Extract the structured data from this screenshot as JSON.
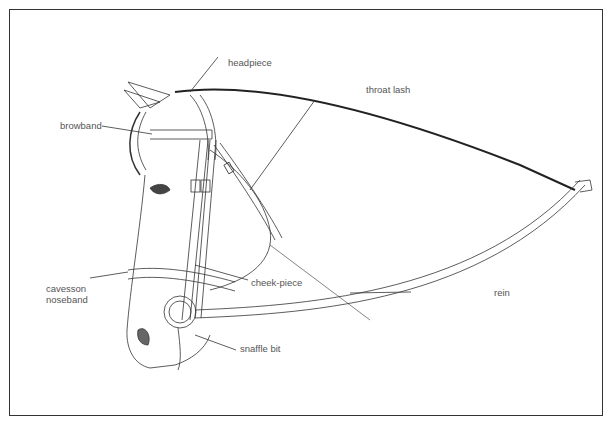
{
  "diagram": {
    "labels": {
      "headpiece": "headpiece",
      "throat_lash": "throat lash",
      "browband": "browband",
      "cavesson_line1": "cavesson",
      "cavesson_line2": "noseband",
      "cheek_piece": "cheek-piece",
      "rein": "rein",
      "snaffle_bit": "snaffle bit"
    },
    "colors": {
      "line": "#333333",
      "label": "#555555",
      "background": "#ffffff"
    }
  }
}
